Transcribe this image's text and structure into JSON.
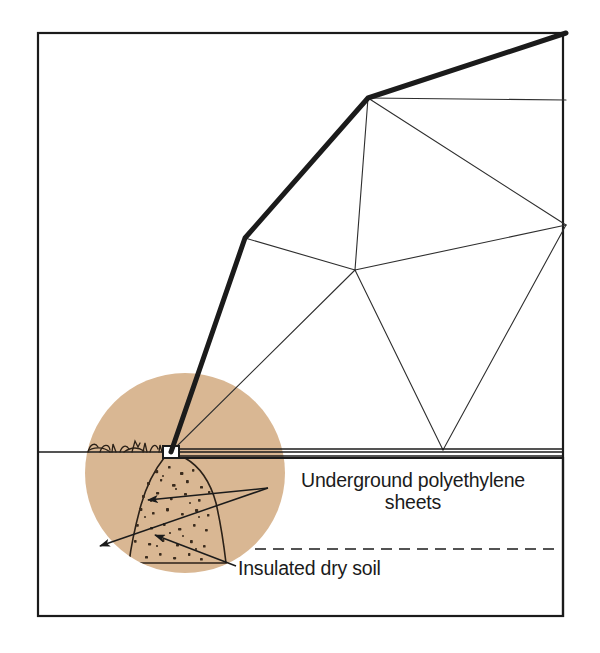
{
  "figure": {
    "kind": "technical-line-diagram",
    "background_color": "#ffffff",
    "ink_color": "#1b1b1b",
    "frame": {
      "x": 38,
      "y": 33,
      "width": 525,
      "height": 583,
      "stroke_color": "#1b1b1b",
      "stroke_width": 2.2
    }
  },
  "labels": {
    "polyethylene": "Underground polyethylene\nsheets",
    "dry_soil": "Insulated dry soil"
  },
  "callout_box": {
    "x": 175,
    "y": 458,
    "width": 388,
    "height": 158,
    "stroke_color": "#1b1b1b",
    "stroke_width": 2.2
  },
  "magnifier": {
    "name": "soil-detail-circle",
    "center_x": 185,
    "center_y": 473,
    "radius": 100,
    "fill_color": "#d9b793",
    "connector_color": "#2a2a2a"
  },
  "ground": {
    "line_y": 452,
    "left_x": 38,
    "right_x": 563,
    "stroke_color": "#1b1b1b",
    "dashed_line_y": 549,
    "dashed_left_x": 255,
    "dashed_right_x": 560
  },
  "anchor": {
    "name": "underground-anchor-plate",
    "x": 163,
    "y": 446,
    "width": 16,
    "height": 12,
    "fill_color": "#ffffff",
    "stroke_color": "#1b1b1b"
  },
  "tether": {
    "name": "main-tether-cable",
    "stroke_color": "#1b1b1b",
    "stroke_width": 5.0,
    "points": [
      [
        171,
        452
      ],
      [
        245,
        238
      ],
      [
        368,
        98
      ],
      [
        566,
        33
      ]
    ]
  },
  "kite_frame": {
    "stroke_color": "#2e2e2e",
    "stroke_width": 1.1,
    "nodes": {
      "left_vertex": [
        245,
        238
      ],
      "upper_bend": [
        368,
        98
      ],
      "top_tip": [
        566,
        33
      ],
      "center_node": [
        355,
        270
      ],
      "right_vertex": [
        566,
        225
      ],
      "bottom_vertex": [
        443,
        450
      ],
      "spar_right_end": [
        566,
        100
      ]
    },
    "edges": [
      [
        [
          245,
          238
        ],
        [
          368,
          98
        ]
      ],
      [
        [
          368,
          98
        ],
        [
          566,
          33
        ]
      ],
      [
        [
          368,
          98
        ],
        [
          566,
          100
        ]
      ],
      [
        [
          368,
          98
        ],
        [
          355,
          270
        ]
      ],
      [
        [
          245,
          238
        ],
        [
          355,
          270
        ]
      ],
      [
        [
          355,
          270
        ],
        [
          566,
          225
        ]
      ],
      [
        [
          368,
          98
        ],
        [
          566,
          225
        ]
      ],
      [
        [
          566,
          225
        ],
        [
          443,
          450
        ]
      ],
      [
        [
          355,
          270
        ],
        [
          443,
          450
        ]
      ],
      [
        [
          171,
          452
        ],
        [
          245,
          238
        ]
      ],
      [
        [
          171,
          452
        ],
        [
          355,
          270
        ]
      ],
      [
        [
          171,
          452
        ],
        [
          566,
          33
        ]
      ]
    ]
  },
  "soil_mound": {
    "name": "insulated-dry-soil-mound",
    "stroke_color": "#2b2118",
    "speckle_color": "#3a2b1d",
    "outline": "M 163 458 C 155 470, 146 486, 140 506 C 134 528, 130 546, 128 562 L 224 562 C 222 546, 220 526, 216 504 C 211 482, 200 466, 186 458 Z"
  },
  "leader_lines": [
    {
      "name": "polyethylene-leader",
      "from": [
        268,
        488
      ],
      "to": [
        148,
        500
      ],
      "arrow_at": "to"
    },
    {
      "name": "polyethylene-leader-lower",
      "from": [
        268,
        488
      ],
      "to": [
        100,
        546
      ],
      "arrow_at": "to"
    },
    {
      "name": "drysoil-leader",
      "from": [
        236,
        566
      ],
      "to": [
        155,
        535
      ],
      "arrow_at": "to"
    }
  ],
  "sheet_lines": {
    "name": "polyethylene-sheet-lines",
    "stroke_color": "#1b1b1b",
    "upper": [
      [
        179,
        449
      ],
      [
        563,
        449
      ]
    ],
    "lower": [
      [
        179,
        456
      ],
      [
        563,
        456
      ]
    ]
  }
}
